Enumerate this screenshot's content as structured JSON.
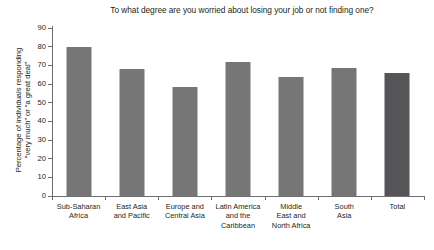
{
  "chart_data": {
    "type": "bar",
    "title": "To what degree are you worried about losing your job or not finding one?",
    "xlabel": "",
    "ylabel_line1": "Percentage of individuals responding",
    "ylabel_line2": "“very much” or “a great deal”",
    "categories": [
      "Sub-Saharan Africa",
      "East Asia and Pacific",
      "Europe and Central Asia",
      "Latin America and the Caribbean",
      "Middle East and North Africa",
      "South Asia",
      "Total"
    ],
    "category_lines": [
      [
        "Sub-Saharan",
        "Africa"
      ],
      [
        "East Asia",
        "and Pacific"
      ],
      [
        "Europe and",
        "Central Asia"
      ],
      [
        "Latin America",
        "and the",
        "Caribbean"
      ],
      [
        "Middle",
        "East and",
        "North Africa"
      ],
      [
        "South",
        "Asia"
      ],
      [
        "Total"
      ]
    ],
    "values": [
      80,
      68,
      58.5,
      72,
      63.5,
      68.5,
      66
    ],
    "ylim": [
      0,
      90
    ],
    "ytick_values": [
      0,
      10,
      20,
      30,
      40,
      50,
      60,
      70,
      80,
      90
    ],
    "ytick_labels": [
      "0",
      "10",
      "20",
      "30",
      "40",
      "50",
      "60",
      "70",
      "80",
      "90"
    ],
    "grid": false,
    "legend": "none",
    "bar_color": "#767676",
    "highlight_color": "#555557",
    "highlight_index": 6,
    "axis_color": "#6d6e71",
    "text_color": "#231f20",
    "background": "#ffffff"
  },
  "artifact": {
    "top_clipped_text": "· · · · · · · · · · · · · · · · · · · · · · · · · · · · · ·"
  }
}
